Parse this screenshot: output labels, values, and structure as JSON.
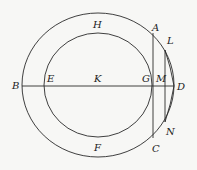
{
  "diagram": {
    "type": "geometry",
    "colors": {
      "background": "#f7f7f5",
      "stroke": "#2a2a2a",
      "label": "#222222"
    },
    "labels": {
      "A": "A",
      "B": "B",
      "C": "C",
      "D": "D",
      "E": "E",
      "F": "F",
      "G": "G",
      "H": "H",
      "K": "K",
      "L": "L",
      "M": "M",
      "N": "N"
    },
    "shapes": {
      "outer_circle": {
        "cx": 98,
        "cy": 85,
        "rx": 76,
        "ry": 72
      },
      "inner_circle": {
        "cx": 98,
        "cy": 85,
        "rx": 54,
        "ry": 52
      },
      "diameter_BD": {
        "from": "B",
        "to": "D"
      },
      "chord_AC": {
        "from": "A",
        "to": "C"
      },
      "chord_LN": {
        "from": "L",
        "to": "N"
      },
      "segments": [
        "LD",
        "DN"
      ]
    }
  }
}
